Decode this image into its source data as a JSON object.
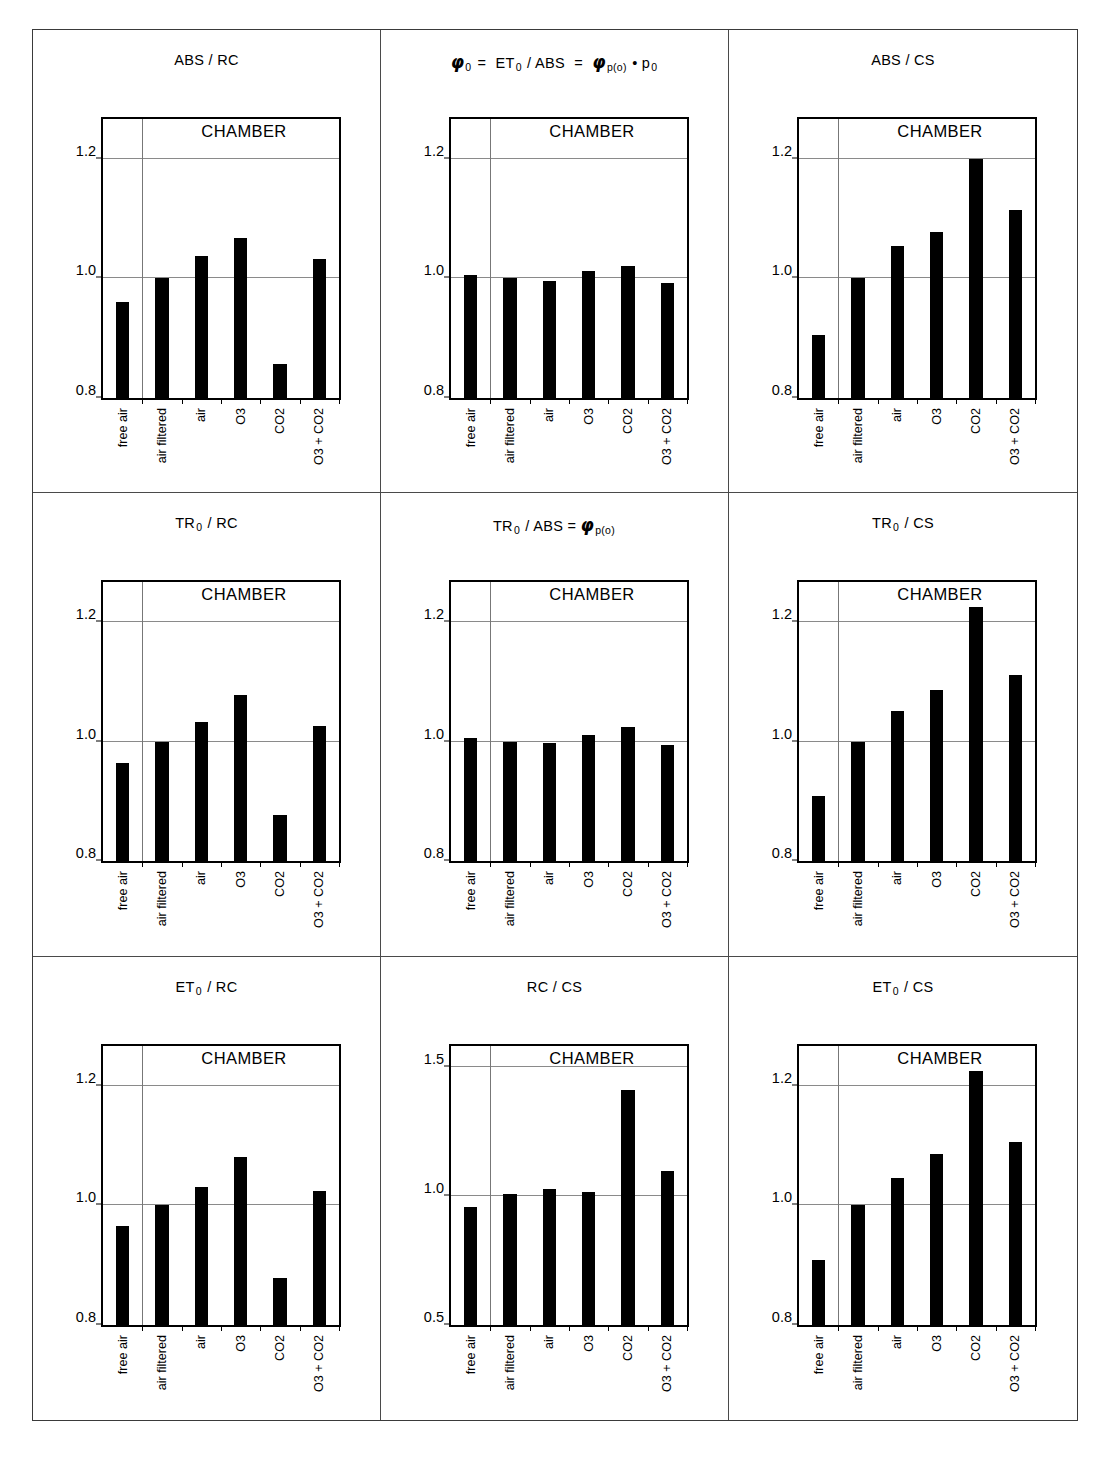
{
  "figure": {
    "categories": [
      "free air",
      "air filtered",
      "air",
      "O3",
      "CO2",
      "O3 + CO2"
    ],
    "group_label": "CHAMBER",
    "panels": [
      {
        "id": "abs-rc",
        "title_html": "ABS / RC",
        "ylim": [
          0.8,
          1.2667
        ],
        "yticks": [
          0.8,
          1.0,
          1.2
        ],
        "ytick_labels": [
          "0.8",
          "1.0",
          "1.2"
        ],
        "values": [
          0.96,
          1.0,
          1.038,
          1.068,
          0.857,
          1.033
        ]
      },
      {
        "id": "phi0",
        "title_html": "phi0 = ET0 / ABS = phi p(o) * p0",
        "ylim": [
          0.8,
          1.2667
        ],
        "yticks": [
          0.8,
          1.0,
          1.2
        ],
        "ytick_labels": [
          "0.8",
          "1.0",
          "1.2"
        ],
        "values": [
          1.006,
          1.0,
          0.995,
          1.012,
          1.021,
          0.993
        ]
      },
      {
        "id": "abs-cs",
        "title_html": "ABS / CS",
        "ylim": [
          0.8,
          1.2667
        ],
        "yticks": [
          0.8,
          1.0,
          1.2
        ],
        "ytick_labels": [
          "0.8",
          "1.0",
          "1.2"
        ],
        "values": [
          0.905,
          1.0,
          1.055,
          1.077,
          1.2,
          1.114
        ]
      },
      {
        "id": "tr0-rc",
        "title_html": "TR0 / RC",
        "ylim": [
          0.8,
          1.2667
        ],
        "yticks": [
          0.8,
          1.0,
          1.2
        ],
        "ytick_labels": [
          "0.8",
          "1.0",
          "1.2"
        ],
        "values": [
          0.964,
          1.0,
          1.033,
          1.079,
          0.878,
          1.026
        ]
      },
      {
        "id": "tr0-abs",
        "title_html": "TR0 / ABS = phi p(o)",
        "ylim": [
          0.8,
          1.2667
        ],
        "yticks": [
          0.8,
          1.0,
          1.2
        ],
        "ytick_labels": [
          "0.8",
          "1.0",
          "1.2"
        ],
        "values": [
          1.007,
          1.0,
          0.998,
          1.011,
          1.024,
          0.995
        ]
      },
      {
        "id": "tr0-cs",
        "title_html": "TR0 / CS",
        "ylim": [
          0.8,
          1.2667
        ],
        "yticks": [
          0.8,
          1.0,
          1.2
        ],
        "ytick_labels": [
          "0.8",
          "1.0",
          "1.2"
        ],
        "values": [
          0.909,
          1.0,
          1.051,
          1.087,
          1.226,
          1.112
        ]
      },
      {
        "id": "et0-rc",
        "title_html": "ET0 / RC",
        "ylim": [
          0.8,
          1.2667
        ],
        "yticks": [
          0.8,
          1.0,
          1.2
        ],
        "ytick_labels": [
          "0.8",
          "1.0",
          "1.2"
        ],
        "values": [
          0.965,
          1.0,
          1.031,
          1.08,
          0.878,
          1.024
        ]
      },
      {
        "id": "rc-cs",
        "title_html": "RC / CS",
        "ylim": [
          0.5,
          1.5833
        ],
        "yticks": [
          0.5,
          1.0,
          1.5
        ],
        "ytick_labels": [
          "0.5",
          "1.0",
          "1.5"
        ],
        "values": [
          0.955,
          1.009,
          1.026,
          1.016,
          1.41,
          1.098
        ]
      },
      {
        "id": "et0-cs",
        "title_html": "ET0 / CS",
        "ylim": [
          0.8,
          1.2667
        ],
        "yticks": [
          0.8,
          1.0,
          1.2
        ],
        "ytick_labels": [
          "0.8",
          "1.0",
          "1.2"
        ],
        "values": [
          0.909,
          1.0,
          1.045,
          1.086,
          1.225,
          1.105
        ]
      }
    ]
  },
  "chart_data": [
    {
      "type": "bar",
      "title": "ABS / RC",
      "categories": [
        "free air",
        "air filtered",
        "air",
        "O3",
        "CO2",
        "O3 + CO2"
      ],
      "values": [
        0.96,
        1.0,
        1.038,
        1.068,
        0.857,
        1.033
      ],
      "xlabel": "",
      "ylabel": "",
      "ylim": [
        0.8,
        1.2667
      ],
      "yticks": [
        0.8,
        1.0,
        1.2
      ],
      "grid": true,
      "annotation": "CHAMBER",
      "note": "vertical divider separates 'free air' (outside) from the five CHAMBER treatments"
    },
    {
      "type": "bar",
      "title": "φ₀ = ET₀ / ABS = φ p(o) • p₀",
      "categories": [
        "free air",
        "air filtered",
        "air",
        "O3",
        "CO2",
        "O3 + CO2"
      ],
      "values": [
        1.006,
        1.0,
        0.995,
        1.012,
        1.021,
        0.993
      ],
      "xlabel": "",
      "ylabel": "",
      "ylim": [
        0.8,
        1.2667
      ],
      "yticks": [
        0.8,
        1.0,
        1.2
      ],
      "grid": true,
      "annotation": "CHAMBER"
    },
    {
      "type": "bar",
      "title": "ABS / CS",
      "categories": [
        "free air",
        "air filtered",
        "air",
        "O3",
        "CO2",
        "O3 + CO2"
      ],
      "values": [
        0.905,
        1.0,
        1.055,
        1.077,
        1.2,
        1.114
      ],
      "xlabel": "",
      "ylabel": "",
      "ylim": [
        0.8,
        1.2667
      ],
      "yticks": [
        0.8,
        1.0,
        1.2
      ],
      "grid": true,
      "annotation": "CHAMBER"
    },
    {
      "type": "bar",
      "title": "TR₀ / RC",
      "categories": [
        "free air",
        "air filtered",
        "air",
        "O3",
        "CO2",
        "O3 + CO2"
      ],
      "values": [
        0.964,
        1.0,
        1.033,
        1.079,
        0.878,
        1.026
      ],
      "xlabel": "",
      "ylabel": "",
      "ylim": [
        0.8,
        1.2667
      ],
      "yticks": [
        0.8,
        1.0,
        1.2
      ],
      "grid": true,
      "annotation": "CHAMBER"
    },
    {
      "type": "bar",
      "title": "TR₀ / ABS = φ p(o)",
      "categories": [
        "free air",
        "air filtered",
        "air",
        "O3",
        "CO2",
        "O3 + CO2"
      ],
      "values": [
        1.007,
        1.0,
        0.998,
        1.011,
        1.024,
        0.995
      ],
      "xlabel": "",
      "ylabel": "",
      "ylim": [
        0.8,
        1.2667
      ],
      "yticks": [
        0.8,
        1.0,
        1.2
      ],
      "grid": true,
      "annotation": "CHAMBER"
    },
    {
      "type": "bar",
      "title": "TR₀ / CS",
      "categories": [
        "free air",
        "air filtered",
        "air",
        "O3",
        "CO2",
        "O3 + CO2"
      ],
      "values": [
        0.909,
        1.0,
        1.051,
        1.087,
        1.226,
        1.112
      ],
      "xlabel": "",
      "ylabel": "",
      "ylim": [
        0.8,
        1.2667
      ],
      "yticks": [
        0.8,
        1.0,
        1.2
      ],
      "grid": true,
      "annotation": "CHAMBER"
    },
    {
      "type": "bar",
      "title": "ET₀ / RC",
      "categories": [
        "free air",
        "air filtered",
        "air",
        "O3",
        "CO2",
        "O3 + CO2"
      ],
      "values": [
        0.965,
        1.0,
        1.031,
        1.08,
        0.878,
        1.024
      ],
      "xlabel": "",
      "ylabel": "",
      "ylim": [
        0.8,
        1.2667
      ],
      "yticks": [
        0.8,
        1.0,
        1.2
      ],
      "grid": true,
      "annotation": "CHAMBER"
    },
    {
      "type": "bar",
      "title": "RC / CS",
      "categories": [
        "free air",
        "air filtered",
        "air",
        "O3",
        "CO2",
        "O3 + CO2"
      ],
      "values": [
        0.955,
        1.009,
        1.026,
        1.016,
        1.41,
        1.098
      ],
      "xlabel": "",
      "ylabel": "",
      "ylim": [
        0.5,
        1.5833
      ],
      "yticks": [
        0.5,
        1.0,
        1.5
      ],
      "grid": true,
      "annotation": "CHAMBER"
    },
    {
      "type": "bar",
      "title": "ET₀ / CS",
      "categories": [
        "free air",
        "air filtered",
        "air",
        "O3",
        "CO2",
        "O3 + CO2"
      ],
      "values": [
        0.909,
        1.0,
        1.045,
        1.086,
        1.225,
        1.105
      ],
      "xlabel": "",
      "ylabel": "",
      "ylim": [
        0.8,
        1.2667
      ],
      "yticks": [
        0.8,
        1.0,
        1.2
      ],
      "grid": true,
      "annotation": "CHAMBER"
    }
  ]
}
